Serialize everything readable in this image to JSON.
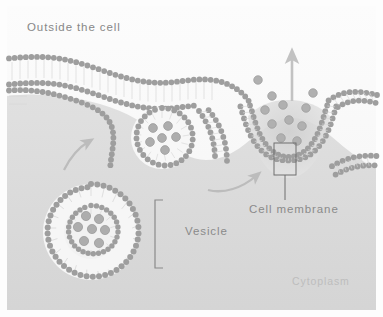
{
  "figure": {
    "canvas": {
      "width": 383,
      "height": 317
    },
    "background_color": "#fdfdfd",
    "frame_color": "#e9e9e9"
  },
  "labels": {
    "outside": "Outside the cell",
    "cytoplasm": "Cytoplasm",
    "vesicle": "Vesicle",
    "cell_membrane": "Cell membrane"
  },
  "colors": {
    "lipid_head": "#9a9a9a",
    "lipid_head_light": "#b6b6b6",
    "lipid_tail": "#d2d2d2",
    "cargo_particle": "#a8a8a8",
    "cargo_particle_edge": "#8f8f8f",
    "arrow": "#b9b9b9",
    "callout_line": "#6f6f6f",
    "text": "#8a8a8a",
    "text_faint": "#bdbdbd",
    "cytosol_fill": "#dcdcdc",
    "extracell_fill": "#fafafa"
  },
  "structures": {
    "membrane": {
      "name": "plasma-membrane",
      "type": "phospholipid-bilayer",
      "leaflets": 2,
      "description": "Continuous bilayer running left to right, dipping into a deep invagination at the fusion pore on the right"
    },
    "vesicles": [
      {
        "name": "large-vesicle",
        "cx": 91,
        "cy": 232,
        "outer_radius": 48,
        "inner_radius": 27,
        "bilayer": true,
        "cargo_count": 7,
        "state": "free-in-cytoplasm"
      },
      {
        "name": "fusing-vesicle",
        "cx": 162,
        "cy": 138,
        "outer_radius": 31,
        "inner_radius": 31,
        "bilayer": false,
        "cargo_count": 6,
        "state": "approaching-membrane"
      }
    ],
    "fusion_pore": {
      "name": "fusion-pore",
      "cx": 288,
      "cy": 160,
      "released_particle_count": 11,
      "state": "open-releasing-contents"
    },
    "arrows": [
      {
        "name": "transport-arrow-1",
        "kind": "curved",
        "direction": "up-right"
      },
      {
        "name": "transport-arrow-2",
        "kind": "curved",
        "direction": "up-right"
      },
      {
        "name": "release-arrow",
        "kind": "straight",
        "direction": "up"
      }
    ],
    "callouts": [
      {
        "name": "cell-membrane-callout",
        "kind": "box-with-leader",
        "target": "membrane bilayer at fusion pore"
      },
      {
        "name": "vesicle-bracket",
        "kind": "vertical-bracket",
        "target": "large vesicle"
      }
    ]
  }
}
